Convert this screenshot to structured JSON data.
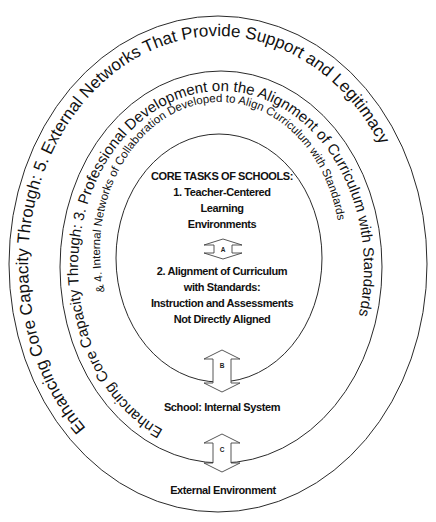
{
  "diagram": {
    "outer_ring": {
      "text": "Enhancing Core Capacity Through: 5. External Networks That Provide Support and Legitimacy"
    },
    "middle_ring": {
      "text": "Enhancing Core Capacity Through: 3. Professional Development on the Alignment of Curriculum with Standards",
      "subtext": "& 4. Internal Networks of Collaboration Developed to Align Curriculum with Standards"
    },
    "core": {
      "title": "CORE TASKS OF SCHOOLS:",
      "task1_lines": [
        "1. Teacher-Centered",
        "Learning",
        "Environments"
      ],
      "task2_lines": [
        "2. Alignment of Curriculum",
        "with Standards:",
        "Instruction and Assessments",
        "Not Directly Aligned"
      ]
    },
    "arrows": {
      "a": "A",
      "b": "B",
      "c": "C"
    },
    "labels": {
      "internal_system": "School: Internal System",
      "external_environment": "External Environment"
    },
    "colors": {
      "stroke": "#2a2a2a",
      "text": "#111111",
      "background": "#ffffff"
    }
  }
}
